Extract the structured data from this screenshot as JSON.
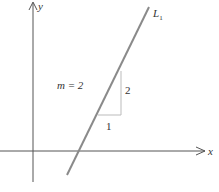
{
  "diagram": {
    "type": "coordinate-plane-line-slope",
    "axes": {
      "x_label": "x",
      "y_label": "y"
    },
    "line": {
      "label_main": "L",
      "label_sub": "1",
      "slope_text": "m = 2",
      "color": "#8a8a8a"
    },
    "slope_triangle": {
      "run_label": "1",
      "rise_label": "2",
      "color": "#bbbbbb"
    },
    "colors": {
      "axis": "#555555",
      "text": "#333333"
    }
  }
}
